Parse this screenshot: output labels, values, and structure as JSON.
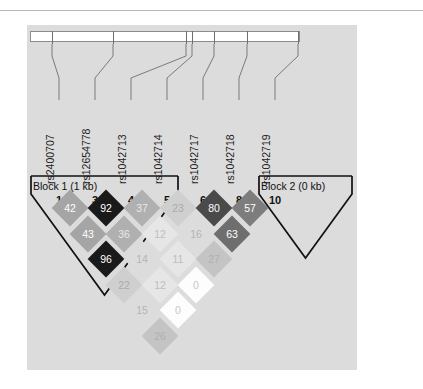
{
  "figure": {
    "type": "ld-plot",
    "panel_background": "#dcdcdc",
    "page_background": "#ffffff"
  },
  "markers": {
    "labels": [
      "rs2400707",
      "rs12654778",
      "rs1042713",
      "rs1042714",
      "rs1042717",
      "rs1042718",
      "rs1042719"
    ],
    "numbers": [
      "1",
      "3",
      "4",
      "5",
      "6",
      "8",
      "10"
    ]
  },
  "blocks": [
    {
      "label": "Block 1 (1 kb)"
    },
    {
      "label": "Block 2 (0 kb)"
    }
  ],
  "chart_data": {
    "type": "heatmap",
    "title": "",
    "xlabel": "",
    "ylabel": "",
    "measure": "D'",
    "scale": "0-100",
    "categories": [
      "rs2400707",
      "rs12654778",
      "rs1042713",
      "rs1042714",
      "rs1042717",
      "rs1042718",
      "rs1042719"
    ],
    "marker_numbers": [
      "1",
      "3",
      "4",
      "5",
      "6",
      "8",
      "10"
    ],
    "rows": [
      {
        "offset": 1,
        "values": [
          42,
          92,
          37,
          23,
          80,
          57
        ]
      },
      {
        "offset": 2,
        "values": [
          43,
          36,
          12,
          16,
          63
        ]
      },
      {
        "offset": 3,
        "values": [
          96,
          14,
          11,
          27
        ]
      },
      {
        "offset": 4,
        "values": [
          22,
          12,
          0
        ]
      },
      {
        "offset": 5,
        "values": [
          15,
          0
        ]
      },
      {
        "offset": 6,
        "values": [
          26
        ]
      }
    ],
    "pairs": [
      {
        "i": 0,
        "j": 1,
        "value": 42
      },
      {
        "i": 1,
        "j": 2,
        "value": 92
      },
      {
        "i": 2,
        "j": 3,
        "value": 37
      },
      {
        "i": 3,
        "j": 4,
        "value": 23
      },
      {
        "i": 4,
        "j": 5,
        "value": 80
      },
      {
        "i": 5,
        "j": 6,
        "value": 57
      },
      {
        "i": 0,
        "j": 2,
        "value": 43
      },
      {
        "i": 1,
        "j": 3,
        "value": 36
      },
      {
        "i": 2,
        "j": 4,
        "value": 12
      },
      {
        "i": 3,
        "j": 5,
        "value": 16
      },
      {
        "i": 4,
        "j": 6,
        "value": 63
      },
      {
        "i": 0,
        "j": 3,
        "value": 96
      },
      {
        "i": 1,
        "j": 4,
        "value": 14
      },
      {
        "i": 2,
        "j": 5,
        "value": 11
      },
      {
        "i": 3,
        "j": 6,
        "value": 27
      },
      {
        "i": 0,
        "j": 4,
        "value": 22
      },
      {
        "i": 1,
        "j": 5,
        "value": 12
      },
      {
        "i": 2,
        "j": 6,
        "value": 0
      },
      {
        "i": 0,
        "j": 5,
        "value": 15
      },
      {
        "i": 1,
        "j": 6,
        "value": 0
      },
      {
        "i": 0,
        "j": 6,
        "value": 26
      }
    ],
    "legend_position": "none",
    "grid": false
  }
}
